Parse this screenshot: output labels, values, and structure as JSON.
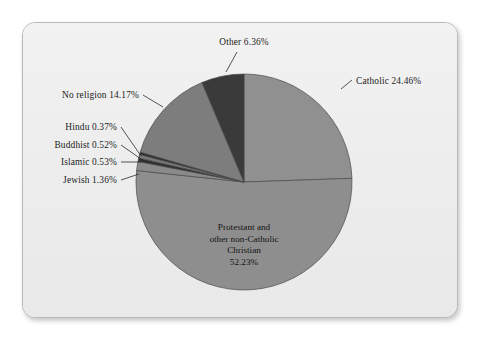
{
  "chart_data": {
    "type": "pie",
    "title": "",
    "subtitle": "",
    "xlabel": "",
    "ylabel": "",
    "legend_position": "none",
    "grid": false,
    "units": "percent",
    "total": 100.0,
    "categories": [
      "Catholic",
      "Protestant and other non-Catholic Christian",
      "Jewish",
      "Islamic",
      "Buddhist",
      "Hindu",
      "No religion",
      "Other"
    ],
    "values": [
      24.46,
      52.23,
      1.36,
      0.53,
      0.52,
      0.37,
      14.17,
      6.36
    ],
    "slices": [
      {
        "name": "Catholic",
        "value": 24.46,
        "value_text": "24.46%",
        "label_text": "Catholic 24.46%",
        "color": "#909090",
        "label_placement": "outside-right",
        "label_x": 356,
        "label_y": 84,
        "leader": [
          [
            341,
            89
          ],
          [
            352,
            80
          ]
        ]
      },
      {
        "name": "Protestant and other non-Catholic Christian",
        "value": 52.23,
        "value_text": "52.23%",
        "label_text": "Protestant and other non-Catholic Christian 52.23%",
        "label_lines": [
          "Protestant and",
          "other non-Catholic",
          "Christian",
          "52.23%"
        ],
        "color": "#8e8e8e",
        "label_placement": "inside",
        "label_x": 244,
        "label_y": 230
      },
      {
        "name": "Jewish",
        "value": 1.36,
        "value_text": "1.36%",
        "label_text": "Jewish 1.36%",
        "color": "#8a8a8a",
        "label_placement": "outside-left",
        "label_x": 117,
        "label_y": 183,
        "leader": [
          [
            121,
            180
          ],
          [
            139,
            174
          ]
        ]
      },
      {
        "name": "Islamic",
        "value": 0.53,
        "value_text": "0.53%",
        "label_text": "Islamic 0.53%",
        "color": "#2f2f2f",
        "label_placement": "outside-left",
        "label_x": 117,
        "label_y": 165,
        "leader": [
          [
            121,
            162
          ],
          [
            141,
            162
          ]
        ]
      },
      {
        "name": "Buddhist",
        "value": 0.52,
        "value_text": "0.52%",
        "label_text": "Buddhist 0.52%",
        "color": "#7a7a7a",
        "label_placement": "outside-left",
        "label_x": 117,
        "label_y": 148,
        "leader": [
          [
            121,
            145
          ],
          [
            141,
            159
          ]
        ]
      },
      {
        "name": "Hindu",
        "value": 0.37,
        "value_text": "0.37%",
        "label_text": "Hindu 0.37%",
        "color": "#2f2f2f",
        "label_placement": "outside-left",
        "label_x": 117,
        "label_y": 130,
        "leader": [
          [
            121,
            127
          ],
          [
            141,
            156
          ]
        ]
      },
      {
        "name": "No religion",
        "value": 14.17,
        "value_text": "14.17%",
        "label_text": "No religion 14.17%",
        "color": "#7d7d7d",
        "label_placement": "outside-left",
        "label_x": 139,
        "label_y": 98,
        "leader": [
          [
            143,
            95
          ],
          [
            163,
            107
          ]
        ]
      },
      {
        "name": "Other",
        "value": 6.36,
        "value_text": "6.36%",
        "label_text": "Other 6.36%",
        "color": "#3a3a3a",
        "label_placement": "outside-top",
        "label_x": 244,
        "label_y": 45,
        "leader": [
          [
            237,
            52
          ],
          [
            226,
            72
          ]
        ]
      }
    ],
    "geometry": {
      "center_x": 244,
      "center_y": 182,
      "radius": 108,
      "start_angle_deg": -90,
      "direction": "clockwise"
    }
  },
  "card": {
    "background_color": "#eeeeee",
    "border_color": "#b9b9b9"
  },
  "colors": {
    "slice_outline": "#4a4a4a",
    "leader_line": "#2b2b2b",
    "label_text": "#1c1c1c",
    "page_background": "#ffffff"
  }
}
